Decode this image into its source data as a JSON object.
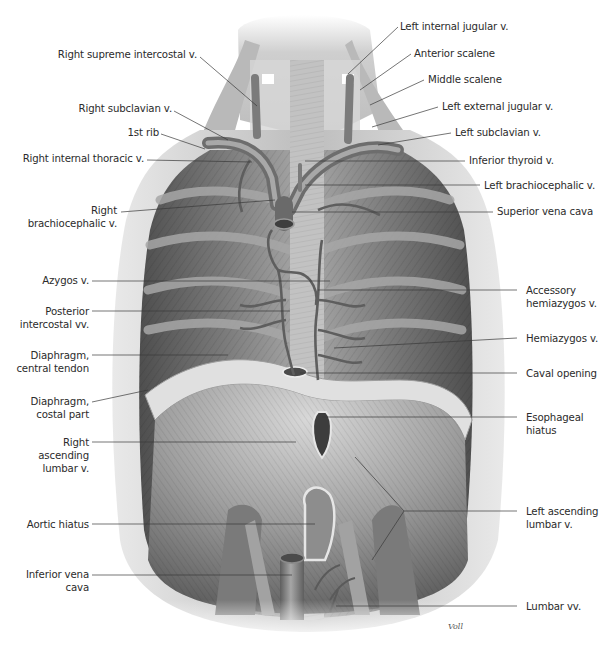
{
  "figure": {
    "signature": "Voll",
    "colors": {
      "background": "#ffffff",
      "label_text": "#2b2b2b",
      "leader_line": "#3a3a3a",
      "muscle_dark": "#5a5a5a",
      "muscle_mid": "#8c8c8c",
      "muscle_light": "#c9c9c9",
      "tendon": "#dedede",
      "vein": "#7a7a7a"
    }
  },
  "labels_left": [
    {
      "id": "right-supreme-intercostal-v",
      "lines": [
        "Right supreme intercostal v."
      ]
    },
    {
      "id": "right-subclavian-v",
      "lines": [
        "Right subclavian v."
      ]
    },
    {
      "id": "first-rib",
      "lines": [
        "1st rib"
      ]
    },
    {
      "id": "right-internal-thoracic-v",
      "lines": [
        "Right internal thoracic v."
      ]
    },
    {
      "id": "right-brachiocephalic-v",
      "lines": [
        "Right",
        "brachiocephalic v."
      ]
    },
    {
      "id": "azygos-v",
      "lines": [
        "Azygos v."
      ]
    },
    {
      "id": "posterior-intercostal-vv",
      "lines": [
        "Posterior",
        "intercostal vv."
      ]
    },
    {
      "id": "diaphragm-central-tendon",
      "lines": [
        "Diaphragm,",
        "central tendon"
      ]
    },
    {
      "id": "diaphragm-costal-part",
      "lines": [
        "Diaphragm,",
        "costal part"
      ]
    },
    {
      "id": "right-ascending-lumbar-v",
      "lines": [
        "Right",
        "ascending",
        "lumbar v."
      ]
    },
    {
      "id": "aortic-hiatus",
      "lines": [
        "Aortic hiatus"
      ]
    },
    {
      "id": "inferior-vena-cava",
      "lines": [
        "Inferior vena",
        "cava"
      ]
    }
  ],
  "labels_right": [
    {
      "id": "left-internal-jugular-v",
      "lines": [
        "Left internal jugular v."
      ]
    },
    {
      "id": "anterior-scalene",
      "lines": [
        "Anterior scalene"
      ]
    },
    {
      "id": "middle-scalene",
      "lines": [
        "Middle scalene"
      ]
    },
    {
      "id": "left-external-jugular-v",
      "lines": [
        "Left external jugular v."
      ]
    },
    {
      "id": "left-subclavian-v",
      "lines": [
        "Left subclavian v."
      ]
    },
    {
      "id": "inferior-thyroid-v",
      "lines": [
        "Inferior thyroid v."
      ]
    },
    {
      "id": "left-brachiocephalic-v",
      "lines": [
        "Left brachiocephalic v."
      ]
    },
    {
      "id": "superior-vena-cava",
      "lines": [
        "Superior vena cava"
      ]
    },
    {
      "id": "accessory-hemiazygos-v",
      "lines": [
        "Accessory",
        "hemiazygos v."
      ]
    },
    {
      "id": "hemiazygos-v",
      "lines": [
        "Hemiazygos v."
      ]
    },
    {
      "id": "caval-opening",
      "lines": [
        "Caval opening"
      ]
    },
    {
      "id": "esophageal-hiatus",
      "lines": [
        "Esophageal",
        "hiatus"
      ]
    },
    {
      "id": "left-ascending-lumbar-v",
      "lines": [
        "Left ascending",
        "lumbar v."
      ]
    },
    {
      "id": "lumbar-vv",
      "lines": [
        "Lumbar vv."
      ]
    }
  ]
}
